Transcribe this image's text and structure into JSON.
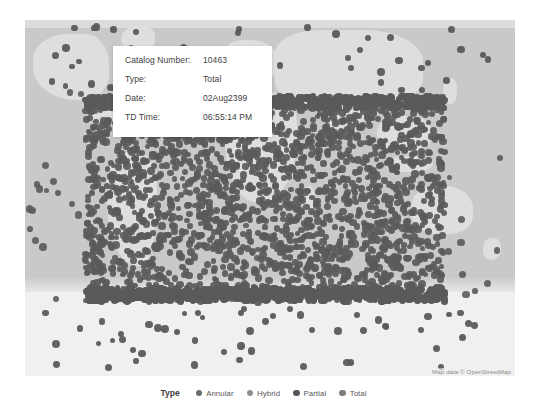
{
  "map": {
    "attribution": "Map data © OpenStreetMap",
    "ocean_color": "#c9c9c9",
    "land_color": "#dedede",
    "antarctic_color": "#f0f0f0",
    "marker_color": "#5a5a5a"
  },
  "tooltip": {
    "rows": [
      {
        "label": "Catalog Number:",
        "value": "10463"
      },
      {
        "label": "Type:",
        "value": "Total"
      },
      {
        "label": "Date:",
        "value": "02Aug2399"
      },
      {
        "label": "TD Time:",
        "value": "06:55:14 PM"
      }
    ]
  },
  "legend": {
    "title": "Type",
    "items": [
      {
        "label": "Annular",
        "color": "#6b6b6b"
      },
      {
        "label": "Hybrid",
        "color": "#8f8f8f"
      },
      {
        "label": "Partial",
        "color": "#555555"
      },
      {
        "label": "Total",
        "color": "#7d7d7d"
      }
    ]
  },
  "chart_data": {
    "type": "scatter",
    "title": "",
    "xlabel": "Longitude",
    "ylabel": "Latitude",
    "series": [
      {
        "name": "Annular",
        "color": "#6b6b6b"
      },
      {
        "name": "Hybrid",
        "color": "#8f8f8f"
      },
      {
        "name": "Partial",
        "color": "#555555"
      },
      {
        "name": "Total",
        "color": "#7d7d7d"
      }
    ],
    "selected_point": {
      "catalog_number": "10463",
      "type": "Total",
      "date": "02Aug2399",
      "td_time": "06:55:14 PM"
    },
    "legend_position": "bottom",
    "grid": false
  }
}
